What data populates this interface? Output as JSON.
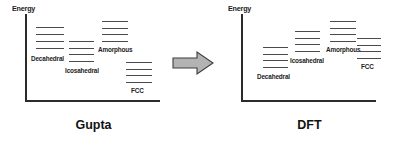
{
  "figure": {
    "type": "energy-level-comparison-diagram",
    "background_color": "#ffffff",
    "level_color": "#4a4a4a",
    "axis_color": "#2b2b2b",
    "arrow": {
      "icon": "right-block-arrow-icon",
      "fill_color": "#b3b3b3",
      "stroke_color": "#3d3d3d",
      "direction": "right"
    }
  },
  "panels": [
    {
      "id": "gupta",
      "title": "Gupta",
      "axis": {
        "y_label": "Energy"
      },
      "groups": [
        {
          "id": "decahedral",
          "label": "Decahedral",
          "levels": 4,
          "energies": [
            0.93,
            0.86,
            0.8,
            0.72
          ],
          "rank": 1
        },
        {
          "id": "icosahedral",
          "label": "Icosahedral",
          "levels": 4,
          "energies": [
            0.76,
            0.7,
            0.64,
            0.58
          ],
          "rank": 2
        },
        {
          "id": "amorphous",
          "label": "Amorphous",
          "levels": 4,
          "energies": [
            1.0,
            0.94,
            0.88,
            0.82
          ],
          "rank": 3
        },
        {
          "id": "fcc",
          "label": "FCC",
          "levels": 4,
          "energies": [
            0.49,
            0.43,
            0.37,
            0.31
          ],
          "rank": 4
        }
      ]
    },
    {
      "id": "dft",
      "title": "DFT",
      "axis": {
        "y_label": "Energy"
      },
      "groups": [
        {
          "id": "decahedral",
          "label": "Decahedral",
          "levels": 4,
          "energies": [
            0.66,
            0.6,
            0.54,
            0.47
          ],
          "rank": 1
        },
        {
          "id": "icosahedral",
          "label": "Icosahedral",
          "levels": 4,
          "energies": [
            0.87,
            0.81,
            0.75,
            0.69
          ],
          "rank": 2
        },
        {
          "id": "amorphous",
          "label": "Amorphous",
          "levels": 4,
          "energies": [
            1.0,
            0.94,
            0.88,
            0.82
          ],
          "rank": 3
        },
        {
          "id": "fcc",
          "label": "FCC",
          "levels": 4,
          "energies": [
            0.78,
            0.72,
            0.66,
            0.6
          ],
          "rank": 4
        }
      ]
    }
  ]
}
